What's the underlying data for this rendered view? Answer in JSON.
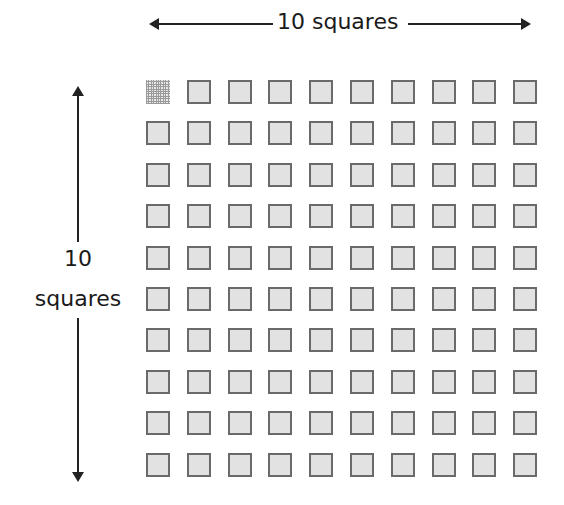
{
  "diagram": {
    "top_label": "10 squares",
    "left_label_line1": "10",
    "left_label_line2": "squares",
    "grid": {
      "rows": 10,
      "columns": 10,
      "total_squares": 100,
      "highlighted_square": {
        "row": 1,
        "column": 1,
        "style": "subdivided grid pattern"
      },
      "square_fill": "#e2e2e2",
      "square_border": "#6a6a6a"
    },
    "arrow_color": "#222222"
  }
}
